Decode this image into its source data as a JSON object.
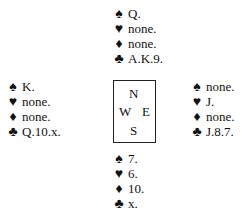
{
  "suits": {
    "spades": "♠",
    "hearts": "♥",
    "diamonds": "♦",
    "clubs": "♣"
  },
  "hands": {
    "north": {
      "spades": "Q.",
      "hearts": "none.",
      "diamonds": "none.",
      "clubs": "A.K.9."
    },
    "west": {
      "spades": "K.",
      "hearts": "none.",
      "diamonds": "none.",
      "clubs": "Q.10.x."
    },
    "east": {
      "spades": "none.",
      "hearts": "J.",
      "diamonds": "none.",
      "clubs": "J.8.7."
    },
    "south": {
      "spades": "7.",
      "hearts": "6.",
      "diamonds": "10.",
      "clubs": "x."
    }
  },
  "compass": {
    "n": "N",
    "w": "W",
    "e": "E",
    "s": "S"
  }
}
